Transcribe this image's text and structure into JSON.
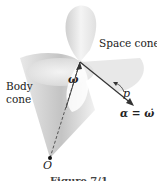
{
  "diagram": {
    "labels": {
      "space_cone": "Space cone",
      "body_cone_line1": "Body",
      "body_cone_line2": "cone",
      "angular_velocity": "ω",
      "p_label": "p",
      "angular_acceleration": "α = ω̇",
      "origin": "O",
      "caption_partial": "Figure 7/1"
    },
    "colors": {
      "cone_shade": "#c8c8c8",
      "cone_light": "#f2f2f2",
      "line": "#333333"
    }
  }
}
